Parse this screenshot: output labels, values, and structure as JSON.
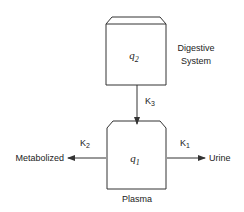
{
  "diagram": {
    "type": "compartment-model",
    "colors": {
      "stroke": "#333333",
      "text": "#222222",
      "background": "#ffffff"
    },
    "compartments": [
      {
        "id": "q2",
        "variable": "q",
        "subscript": "2",
        "label_lines": [
          "Digestive",
          "System"
        ]
      },
      {
        "id": "q1",
        "variable": "q",
        "subscript": "1",
        "label": "Plasma"
      }
    ],
    "flows": [
      {
        "from": "q2",
        "to": "q1",
        "rate": "K",
        "rate_sub": "3"
      },
      {
        "from": "q1",
        "to": "Metabolized",
        "rate": "K",
        "rate_sub": "2"
      },
      {
        "from": "q1",
        "to": "Urine",
        "rate": "K",
        "rate_sub": "1"
      }
    ],
    "sinks": {
      "left": "Metabolized",
      "right": "Urine"
    }
  }
}
